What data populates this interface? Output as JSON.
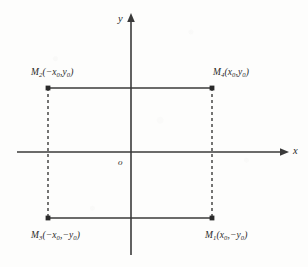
{
  "figure": {
    "name": "rectangle-symmetry-coordinate-diagram",
    "background_color": "#fdfdfc",
    "ink_color": "#2a2a2a"
  },
  "axes": {
    "x_label": "x",
    "y_label": "y",
    "origin_label": "o",
    "x_axis": {
      "y_px": 152,
      "x_start_px": 17,
      "x_end_px": 288,
      "arrow": "right"
    },
    "y_axis": {
      "x_px": 131,
      "y_start_px": 255,
      "y_end_px": 14,
      "arrow": "up"
    }
  },
  "points": [
    {
      "id": "M1",
      "label_base": "M",
      "subscript": "1",
      "coords": "(x",
      "label": "M1(x0,-y0)",
      "x_sign": "+",
      "y_sign": "-",
      "px": {
        "x": 212,
        "y": 218
      }
    },
    {
      "id": "M2",
      "label_base": "M",
      "subscript": "2",
      "label": "M2(-x0,y0)",
      "x_sign": "-",
      "y_sign": "+",
      "px": {
        "x": 48,
        "y": 88
      }
    },
    {
      "id": "M3",
      "label_base": "M",
      "subscript": "3",
      "label": "M3(-x0,-y0)",
      "x_sign": "-",
      "y_sign": "-",
      "px": {
        "x": 48,
        "y": 218
      }
    },
    {
      "id": "M4",
      "label_base": "M",
      "subscript": "4",
      "label": "M4(x0,y0)",
      "x_sign": "+",
      "y_sign": "+",
      "px": {
        "x": 212,
        "y": 88
      }
    }
  ],
  "labels": {
    "m1": {
      "name": "M",
      "sub": "1",
      "open": "(x",
      "sub_x": "0",
      "mid": ",−y",
      "sub_y": "0",
      "close": ")"
    },
    "m2": {
      "name": "M",
      "sub": "2",
      "open": "(−x",
      "sub_x": "0",
      "mid": ",y",
      "sub_y": "0",
      "close": ")"
    },
    "m3": {
      "name": "M",
      "sub": "3",
      "open": "(−x",
      "sub_x": "0",
      "mid": ",−y",
      "sub_y": "0",
      "close": ")"
    },
    "m4": {
      "name": "M",
      "sub": "4",
      "open": "(x",
      "sub_x": "0",
      "mid": ",y",
      "sub_y": "0",
      "close": ")"
    }
  },
  "rectangle": {
    "left_px": 48,
    "right_px": 212,
    "top_px": 88,
    "bottom_px": 218,
    "top_edge_style": "solid",
    "bottom_edge_style": "solid",
    "left_edge_style": "dashed",
    "right_edge_style": "dashed",
    "dash_pattern": "3 3"
  }
}
